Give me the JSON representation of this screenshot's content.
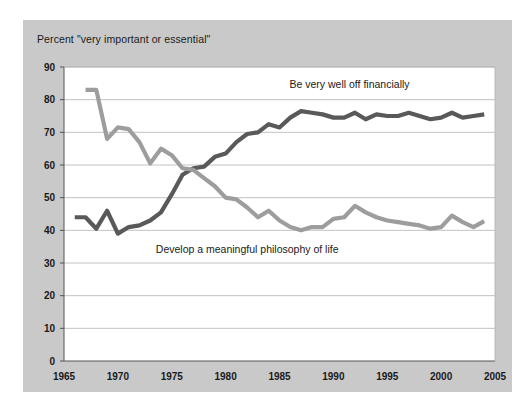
{
  "chart_data": {
    "type": "line",
    "title": "Percent \"very important or essential\"",
    "xlabel": "",
    "ylabel": "",
    "xlim": [
      1965,
      2005
    ],
    "ylim": [
      0,
      90
    ],
    "grid": true,
    "legend_position": "inline-annotations",
    "x_ticks": [
      1965,
      1970,
      1975,
      1980,
      1985,
      1990,
      1995,
      2000,
      2005
    ],
    "y_ticks": [
      0,
      10,
      20,
      30,
      40,
      50,
      60,
      70,
      80,
      90
    ],
    "series": [
      {
        "name": "Be very well off financially",
        "color": "#595959",
        "annotation": "Be very well off financially",
        "x": [
          1966,
          1967,
          1968,
          1969,
          1970,
          1971,
          1972,
          1973,
          1974,
          1975,
          1976,
          1977,
          1978,
          1979,
          1980,
          1981,
          1982,
          1983,
          1984,
          1985,
          1986,
          1987,
          1988,
          1989,
          1990,
          1991,
          1992,
          1993,
          1994,
          1995,
          1996,
          1997,
          1998,
          1999,
          2000,
          2001,
          2002,
          2003,
          2004
        ],
        "values": [
          44,
          44,
          40.5,
          46,
          39,
          41,
          41.5,
          43,
          45.5,
          51,
          57,
          59,
          59.5,
          62.5,
          63.5,
          67,
          69.5,
          70,
          72.5,
          71.5,
          74.5,
          76.5,
          76,
          75.5,
          74.5,
          74.5,
          76,
          74,
          75.5,
          75,
          75,
          76,
          75,
          74,
          74.5,
          76,
          74.5,
          75,
          75.5
        ]
      },
      {
        "name": "Develop a meaningful philosophy of life",
        "color": "#9d9d9d",
        "annotation": "Develop a meaningful philosophy of life",
        "x": [
          1967,
          1968,
          1969,
          1970,
          1971,
          1972,
          1973,
          1974,
          1975,
          1976,
          1977,
          1978,
          1979,
          1980,
          1981,
          1982,
          1983,
          1984,
          1985,
          1986,
          1987,
          1988,
          1989,
          1990,
          1991,
          1992,
          1993,
          1994,
          1995,
          1996,
          1997,
          1998,
          1999,
          2000,
          2001,
          2002,
          2003,
          2004
        ],
        "values": [
          83,
          83,
          68,
          71.5,
          71,
          67,
          60.5,
          65,
          63,
          59,
          58.5,
          56,
          53.5,
          50,
          49.5,
          47,
          44,
          46,
          43,
          41,
          40,
          41,
          41,
          43.5,
          44,
          47.5,
          45.5,
          44,
          43,
          42.5,
          42,
          41.5,
          40.5,
          41,
          44.5,
          42.5,
          41,
          42.8
        ]
      }
    ]
  },
  "annotations": {
    "series_1_label": "Be very well off financially",
    "series_2_label": "Develop a meaningful philosophy of life"
  }
}
